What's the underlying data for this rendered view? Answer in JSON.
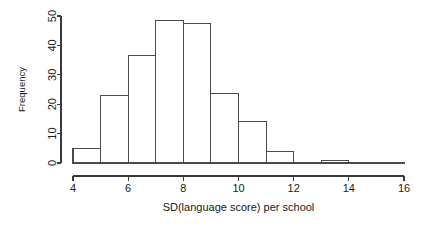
{
  "chart_data": {
    "type": "bar",
    "title": "",
    "subtitle": "",
    "xlabel": "SD(language score) per school",
    "ylabel": "Frequency",
    "xlim": [
      4,
      16
    ],
    "ylim": [
      0,
      50
    ],
    "grid": false,
    "legend": null,
    "bin_width": 1,
    "bin_edges": [
      4,
      5,
      6,
      7,
      8,
      9,
      10,
      11,
      12,
      13,
      14,
      15,
      16
    ],
    "categories": [
      "4-5",
      "5-6",
      "6-7",
      "7-8",
      "8-9",
      "9-10",
      "10-11",
      "11-12",
      "12-13",
      "13-14",
      "14-15",
      "15-16"
    ],
    "values": [
      5,
      23,
      36.5,
      48.5,
      47.5,
      23.5,
      14,
      4,
      0,
      1,
      0,
      0
    ],
    "xticks": [
      4,
      6,
      8,
      10,
      12,
      14,
      16
    ],
    "xtick_labels": [
      "4",
      "6",
      "8",
      "10",
      "12",
      "14",
      "16"
    ],
    "yticks": [
      0,
      10,
      20,
      30,
      40,
      50
    ],
    "ytick_labels": [
      "0",
      "10",
      "20",
      "30",
      "40",
      "50"
    ],
    "colors": {
      "bar_fill": "#ffffff",
      "bar_stroke": "#4a4a4a",
      "axis": "#3a3a3a",
      "text": "#1a1a1a",
      "background": "#ffffff"
    }
  }
}
